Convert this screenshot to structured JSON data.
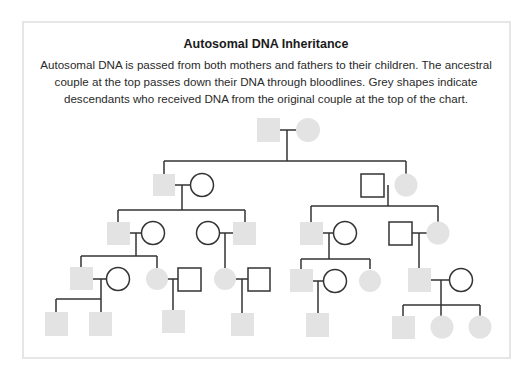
{
  "header": {
    "title": "Autosomal DNA Inheritance",
    "description": "Autosomal DNA is passed from both mothers and fathers to their children. The ancestral couple at the top passes down their DNA through bloodlines. Grey shapes indicate descendants who received DNA from the original couple at the top of the chart."
  },
  "legend": {
    "square": "male",
    "circle": "female",
    "grey_fill": "descendant who received DNA from original couple",
    "white_fill": "spouse (no DNA from original couple)"
  },
  "colors": {
    "descendant_fill": "#e3e3e3",
    "spouse_fill": "#ffffff",
    "line": "#333333",
    "frame_border": "#e6e6e6"
  },
  "generations": [
    {
      "level": 1,
      "members": [
        {
          "id": "g1-m",
          "shape": "square",
          "descendant": true
        },
        {
          "id": "g1-f",
          "shape": "circle",
          "descendant": true
        }
      ]
    },
    {
      "level": 2,
      "members": [
        {
          "id": "g2a-m",
          "shape": "square",
          "descendant": true
        },
        {
          "id": "g2a-f",
          "shape": "circle",
          "descendant": false
        },
        {
          "id": "g2b-m",
          "shape": "square",
          "descendant": false
        },
        {
          "id": "g2b-f",
          "shape": "circle",
          "descendant": true
        }
      ]
    },
    {
      "level": 3,
      "members": [
        {
          "id": "g3a-m",
          "shape": "square",
          "descendant": true
        },
        {
          "id": "g3a-f",
          "shape": "circle",
          "descendant": false
        },
        {
          "id": "g3b-f",
          "shape": "circle",
          "descendant": false
        },
        {
          "id": "g3b-m",
          "shape": "square",
          "descendant": true
        },
        {
          "id": "g3c-m",
          "shape": "square",
          "descendant": true
        },
        {
          "id": "g3c-f",
          "shape": "circle",
          "descendant": false
        },
        {
          "id": "g3d-m",
          "shape": "square",
          "descendant": false
        },
        {
          "id": "g3d-f",
          "shape": "circle",
          "descendant": true
        }
      ]
    },
    {
      "level": 4,
      "members": [
        {
          "id": "g4a-m",
          "shape": "square",
          "descendant": true
        },
        {
          "id": "g4a-f",
          "shape": "circle",
          "descendant": false
        },
        {
          "id": "g4b-f",
          "shape": "circle",
          "descendant": true
        },
        {
          "id": "g4b-m",
          "shape": "square",
          "descendant": false
        },
        {
          "id": "g4c-f",
          "shape": "circle",
          "descendant": true
        },
        {
          "id": "g4c-m",
          "shape": "square",
          "descendant": false
        },
        {
          "id": "g4d-m",
          "shape": "square",
          "descendant": true
        },
        {
          "id": "g4d-f",
          "shape": "circle",
          "descendant": false
        },
        {
          "id": "g4e-f",
          "shape": "circle",
          "descendant": true
        },
        {
          "id": "g4f-m",
          "shape": "square",
          "descendant": true
        },
        {
          "id": "g4f-f",
          "shape": "circle",
          "descendant": false
        }
      ]
    },
    {
      "level": 5,
      "members": [
        {
          "id": "g5a",
          "shape": "square",
          "descendant": true
        },
        {
          "id": "g5b",
          "shape": "square",
          "descendant": true
        },
        {
          "id": "g5c",
          "shape": "square",
          "descendant": true
        },
        {
          "id": "g5d",
          "shape": "square",
          "descendant": true
        },
        {
          "id": "g5e",
          "shape": "square",
          "descendant": true
        },
        {
          "id": "g5f",
          "shape": "square",
          "descendant": true
        },
        {
          "id": "g5g",
          "shape": "circle",
          "descendant": true
        },
        {
          "id": "g5h",
          "shape": "circle",
          "descendant": true
        }
      ]
    }
  ]
}
